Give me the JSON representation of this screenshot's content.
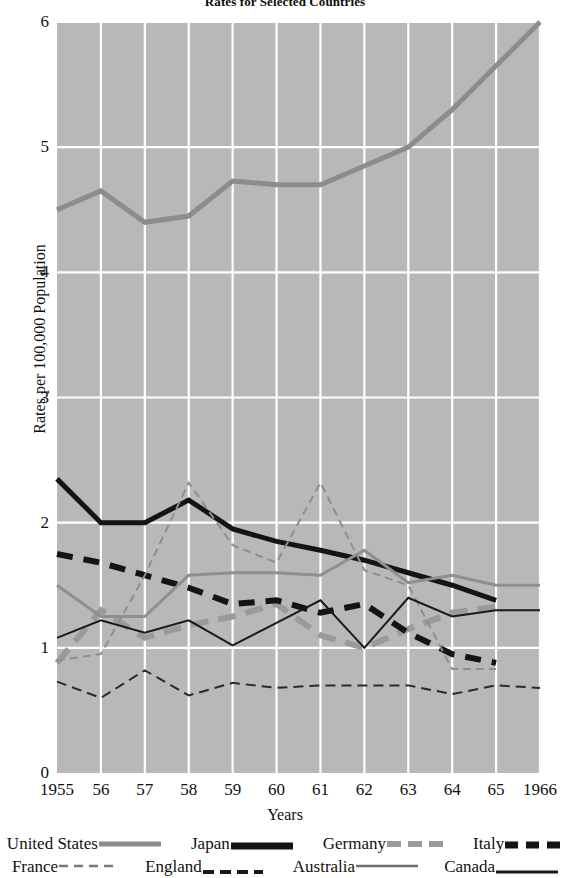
{
  "chart_data": {
    "type": "line",
    "title": "Rates for Selected Countries",
    "xlabel": "Years",
    "ylabel": "Rates per 100,000 Population",
    "x": [
      1955,
      1956,
      1957,
      1958,
      1959,
      1960,
      1961,
      1962,
      1963,
      1964,
      1965,
      1966
    ],
    "xticklabels": [
      "1955",
      "56",
      "57",
      "58",
      "59",
      "60",
      "61",
      "62",
      "63",
      "64",
      "65",
      "1966"
    ],
    "yticklabels": [
      "0",
      "1",
      "2",
      "3",
      "4",
      "5",
      "6"
    ],
    "yticks": [
      0,
      1,
      2,
      3,
      4,
      5,
      6
    ],
    "xlim": [
      1955,
      1966
    ],
    "ylim": [
      0,
      6
    ],
    "grid": true,
    "grid_color": "#ffffff",
    "plot_background": "#b8b8b8",
    "legend_position": "below-axis",
    "series": [
      {
        "name": "United States",
        "color": "#8c8c8c",
        "width": 5,
        "dash": "none",
        "values": [
          4.5,
          4.65,
          4.4,
          4.45,
          4.73,
          4.7,
          4.7,
          4.85,
          5.0,
          5.3,
          5.65,
          6.0
        ]
      },
      {
        "name": "Japan",
        "color": "#141414",
        "width": 5,
        "dash": "none",
        "values": [
          2.35,
          2.0,
          2.0,
          2.18,
          1.95,
          1.85,
          1.78,
          1.7,
          1.6,
          1.5,
          1.38,
          null
        ]
      },
      {
        "name": "Germany",
        "color": "#9a9a9a",
        "width": 6,
        "dash": "18,10",
        "values": [
          0.88,
          1.3,
          1.08,
          1.18,
          1.25,
          1.35,
          1.1,
          1.0,
          1.15,
          1.28,
          1.33,
          null
        ]
      },
      {
        "name": "Italy",
        "color": "#141414",
        "width": 6,
        "dash": "16,11",
        "values": [
          1.75,
          1.68,
          1.58,
          1.48,
          1.35,
          1.38,
          1.28,
          1.35,
          1.12,
          0.95,
          0.88,
          null
        ]
      },
      {
        "name": "France",
        "color": "#8f8f8f",
        "width": 2,
        "dash": "8,5",
        "values": [
          0.9,
          0.95,
          1.58,
          2.32,
          1.82,
          1.68,
          2.32,
          1.62,
          1.5,
          0.83,
          0.83,
          null
        ]
      },
      {
        "name": "England",
        "color": "#2a2a2a",
        "width": 2,
        "dash": "10,6",
        "values": [
          0.73,
          0.6,
          0.82,
          0.62,
          0.72,
          0.68,
          0.7,
          0.7,
          0.7,
          0.63,
          0.7,
          0.68
        ]
      },
      {
        "name": "Australia",
        "color": "#8f8f8f",
        "width": 3,
        "dash": "none",
        "values": [
          1.5,
          1.25,
          1.25,
          1.58,
          1.6,
          1.6,
          1.58,
          1.78,
          1.52,
          1.58,
          1.5,
          1.5
        ]
      },
      {
        "name": "Canada",
        "color": "#1a1a1a",
        "width": 2,
        "dash": "none",
        "values": [
          1.08,
          1.22,
          1.12,
          1.22,
          1.02,
          1.2,
          1.38,
          1.0,
          1.4,
          1.25,
          1.3,
          1.3
        ]
      }
    ]
  },
  "legend": {
    "rows": [
      [
        {
          "label": "United States",
          "style": "solid-thick-gray"
        },
        {
          "label": "Japan",
          "style": "solid-thick-black"
        },
        {
          "label": "Germany",
          "style": "dashed-thick-gray"
        },
        {
          "label": "Italy",
          "style": "dashed-thick-black"
        }
      ],
      [
        {
          "label": "France",
          "style": "dashed-thin-gray"
        },
        {
          "label": "England",
          "style": "dashed-thick-black-low"
        },
        {
          "label": "Australia",
          "style": "solid-thin-gray"
        },
        {
          "label": "Canada",
          "style": "solid-thin-black-low"
        }
      ]
    ]
  }
}
